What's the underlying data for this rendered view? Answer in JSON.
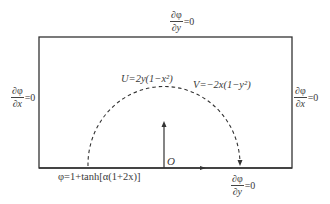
{
  "diagram": {
    "boundaries": {
      "top": {
        "numerator": "∂φ",
        "denominator": "∂y",
        "rhs": "=0"
      },
      "left": {
        "numerator": "∂φ",
        "denominator": "∂x",
        "rhs": "=0"
      },
      "right": {
        "numerator": "∂φ",
        "denominator": "∂x",
        "rhs": "=0"
      },
      "bottom": {
        "numerator": "∂φ",
        "denominator": "∂y",
        "rhs": "=0"
      }
    },
    "initial_condition": "φ=1+tanh[α(1+2x)]",
    "velocity_u": "U=2y(1−x²)",
    "velocity_v": "V=−2x(1−y²)",
    "origin_label": "O",
    "colors": {
      "line": "#333333",
      "background": "#ffffff"
    }
  }
}
